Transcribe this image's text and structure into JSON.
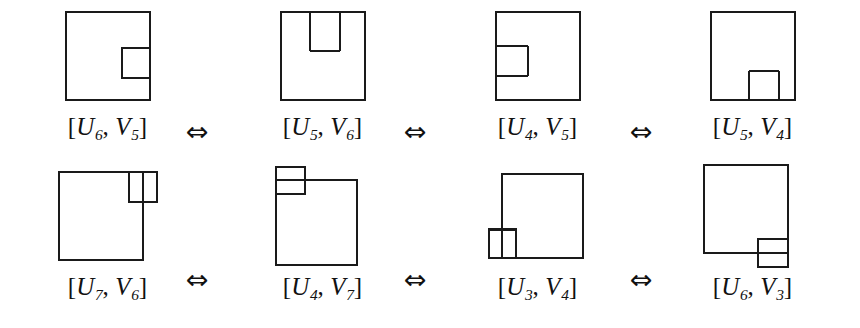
{
  "figure": {
    "caption_equiv_symbol": "⇔",
    "stroke_color": "#1a1a1a",
    "background_color": "#ffffff",
    "rows": [
      {
        "row_id": "top",
        "items": [
          {
            "label_text": "[U6, V5]",
            "bracket_open": "[",
            "bracket_close": "]",
            "comma": ",",
            "u_letter": "U",
            "u_index": "6",
            "v_letter": "V",
            "v_index": "5",
            "shape": "square-with-notch-right-middle"
          },
          {
            "label_text": "[U5, V6]",
            "bracket_open": "[",
            "bracket_close": "]",
            "comma": ",",
            "u_letter": "U",
            "u_index": "5",
            "v_letter": "V",
            "v_index": "6",
            "shape": "square-with-notch-top-center"
          },
          {
            "label_text": "[U4, V5]",
            "bracket_open": "[",
            "bracket_close": "]",
            "comma": ",",
            "u_letter": "U",
            "u_index": "4",
            "v_letter": "V",
            "v_index": "5",
            "shape": "square-with-notch-left-upper"
          },
          {
            "label_text": "[U5, V4]",
            "bracket_open": "[",
            "bracket_close": "]",
            "comma": ",",
            "u_letter": "U",
            "u_index": "5",
            "v_letter": "V",
            "v_index": "4",
            "shape": "square-with-notch-bottom-center"
          }
        ],
        "arrows": [
          "⇔",
          "⇔",
          "⇔"
        ]
      },
      {
        "row_id": "bottom",
        "items": [
          {
            "label_text": "[U7, V6]",
            "bracket_open": "[",
            "bracket_close": "]",
            "comma": ",",
            "u_letter": "U",
            "u_index": "7",
            "v_letter": "V",
            "v_index": "6",
            "shape": "square-with-two-cells-top-right-overhang"
          },
          {
            "label_text": "[U4, V7]",
            "bracket_open": "[",
            "bracket_close": "]",
            "comma": ",",
            "u_letter": "U",
            "u_index": "4",
            "v_letter": "V",
            "v_index": "7",
            "shape": "square-with-two-cells-top-left-overhang"
          },
          {
            "label_text": "[U3, V4]",
            "bracket_open": "[",
            "bracket_close": "]",
            "comma": ",",
            "u_letter": "U",
            "u_index": "3",
            "v_letter": "V",
            "v_index": "4",
            "shape": "square-with-two-cells-bottom-left-overhang"
          },
          {
            "label_text": "[U6, V3]",
            "bracket_open": "[",
            "bracket_close": "]",
            "comma": ",",
            "u_letter": "U",
            "u_index": "6",
            "v_letter": "V",
            "v_index": "3",
            "shape": "square-with-two-cells-bottom-right-overhang"
          }
        ],
        "arrows": [
          "⇔",
          "⇔",
          "⇔"
        ]
      }
    ]
  }
}
